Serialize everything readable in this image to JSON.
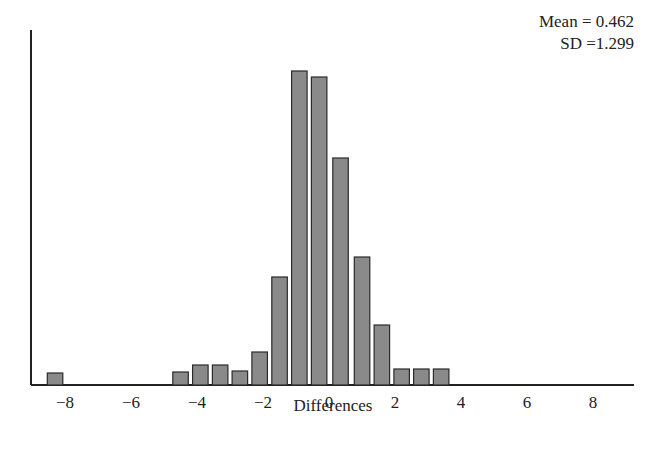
{
  "chart_data": {
    "type": "bar",
    "title": "",
    "xlabel": "Differences",
    "ylabel": "",
    "annotations": [
      "Mean = 0.462",
      "SD =1.299"
    ],
    "x_ticks": [
      -8,
      -6,
      -4,
      -2,
      0,
      2,
      4,
      6,
      8
    ],
    "x_tick_labels": [
      "−8",
      "−6",
      "−4",
      "−2",
      "0",
      "2",
      "4",
      "6",
      "8"
    ],
    "xlim": [
      -9.3,
      9.2
    ],
    "grid": false,
    "legend": null,
    "bin_width": 0.5,
    "bin_centers": [
      -8.3,
      -4.5,
      -3.9,
      -3.3,
      -2.7,
      -2.1,
      -1.5,
      -0.9,
      -0.3,
      0.35,
      1.0,
      1.6,
      2.2,
      2.8,
      3.4
    ],
    "values": [
      12,
      13,
      20,
      20,
      14,
      33,
      108,
      314,
      308,
      227,
      128,
      60,
      16,
      16,
      16
    ],
    "value_units": "relative bar height (no y-axis scale shown)"
  },
  "stats": {
    "mean_label": "Mean = 0.462",
    "sd_label": "SD =1.299"
  },
  "axis": {
    "xlabel": "Differences"
  },
  "style": {
    "bar_fill": "#8a8a8a",
    "bar_stroke": "#2a2a2a",
    "axis_color": "#222222"
  }
}
